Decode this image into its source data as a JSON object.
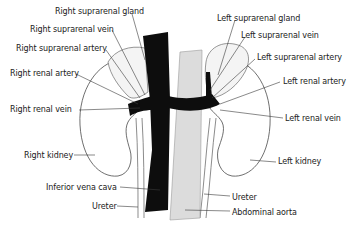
{
  "diagram": {
    "labels_left": [
      {
        "id": "right-suprarenal-gland",
        "text": "Right suprarenal gland",
        "x": 55,
        "y": 7
      },
      {
        "id": "right-suprarenal-vein",
        "text": "Right suprarenal vein",
        "x": 30,
        "y": 25
      },
      {
        "id": "right-suprarenal-artery",
        "text": "Right suprarenal artery",
        "x": 16,
        "y": 44
      },
      {
        "id": "right-renal-artery",
        "text": "Right renal artery",
        "x": 10,
        "y": 69
      },
      {
        "id": "right-renal-vein",
        "text": "Right renal vein",
        "x": 10,
        "y": 105
      },
      {
        "id": "right-kidney",
        "text": "Right kidney",
        "x": 24,
        "y": 151
      },
      {
        "id": "inferior-vena-cava",
        "text": "Inferior vena cava",
        "x": 46,
        "y": 183
      },
      {
        "id": "ureter-right",
        "text": "Ureter",
        "x": 92,
        "y": 202
      }
    ],
    "labels_right": [
      {
        "id": "left-suprarenal-gland",
        "text": "Left suprarenal gland",
        "x": 217,
        "y": 14
      },
      {
        "id": "left-suprarenal-vein",
        "text": "Left suprarenal vein",
        "x": 241,
        "y": 31
      },
      {
        "id": "left-suprarenal-artery",
        "text": "Left suprarenal artery",
        "x": 257,
        "y": 53
      },
      {
        "id": "left-renal-artery",
        "text": "Left renal artery",
        "x": 283,
        "y": 77
      },
      {
        "id": "left-renal-vein",
        "text": "Left renal vein",
        "x": 285,
        "y": 114
      },
      {
        "id": "left-kidney",
        "text": "Left kidney",
        "x": 278,
        "y": 157
      },
      {
        "id": "ureter-left",
        "text": "Ureter",
        "x": 232,
        "y": 193
      },
      {
        "id": "abdominal-aorta",
        "text": "Abdominal aorta",
        "x": 232,
        "y": 208
      }
    ],
    "colors": {
      "vena_cava": "#0d0d0d",
      "aorta": "#dcdcdc",
      "outline": "#4a4a4a",
      "gland_fill": "#f4f4f4",
      "text": "#1a1a1a"
    }
  }
}
